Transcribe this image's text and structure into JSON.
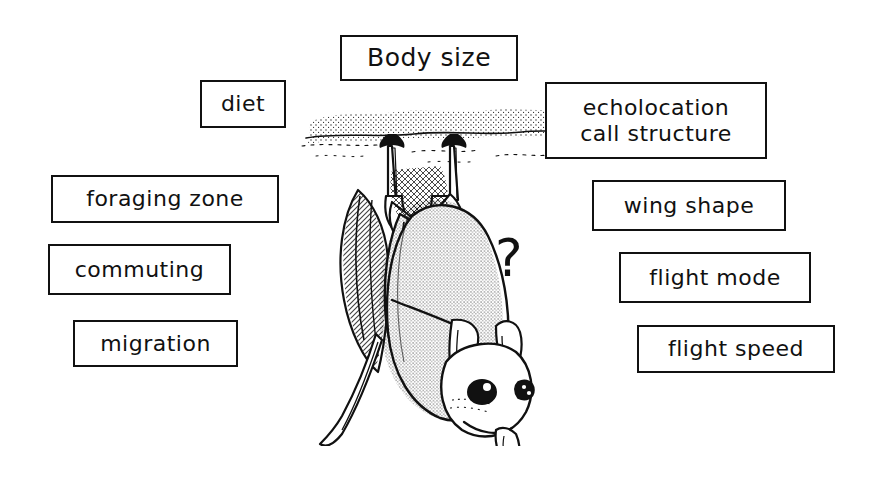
{
  "figure": {
    "background_color": "#ffffff",
    "ink_color": "#111111",
    "width": 876,
    "height": 479
  },
  "boxes": [
    {
      "id": "body-size",
      "label": "Body size"
    },
    {
      "id": "diet",
      "label": "diet"
    },
    {
      "id": "echolocation",
      "label": "echolocation\ncall structure"
    },
    {
      "id": "foraging",
      "label": "foraging  zone"
    },
    {
      "id": "wing-shape",
      "label": "wing  shape"
    },
    {
      "id": "commuting",
      "label": "commuting"
    },
    {
      "id": "flight-mode",
      "label": "flight  mode"
    },
    {
      "id": "migration",
      "label": "migration"
    },
    {
      "id": "flight-speed",
      "label": "flight  speed"
    }
  ],
  "annotation": {
    "question_mark": "?"
  },
  "illustration": {
    "subject": "bat-hanging-upside-down",
    "description": "line drawing of a bat roosting upside down from a stippled cave ceiling"
  }
}
